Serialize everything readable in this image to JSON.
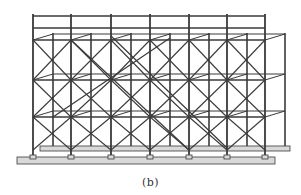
{
  "figure": {
    "caption": "(b)",
    "line_color": "#3a3a3a",
    "plank_color": "#d9d9d9",
    "background": "#ffffff",
    "front_posts_x": [
      33,
      71,
      111,
      150,
      189,
      227,
      265
    ],
    "back_offset": [
      20,
      -6
    ],
    "levels_y": [
      40,
      80,
      117,
      150
    ],
    "top_rails_y": [
      16,
      28
    ]
  }
}
